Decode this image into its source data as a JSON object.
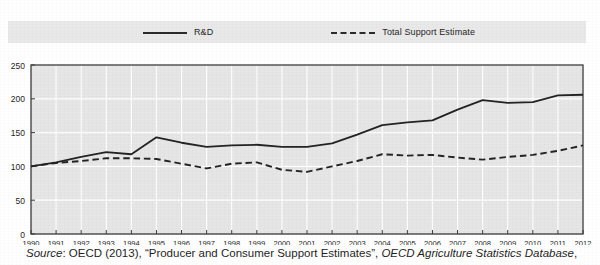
{
  "legend": {
    "position": "top",
    "entries": [
      {
        "label": "R&D",
        "style": "solid",
        "icon": "solid-line-icon"
      },
      {
        "label": "Total Support Estimate",
        "style": "dashed",
        "icon": "dashed-line-icon"
      }
    ]
  },
  "caption": {
    "source_word": "Source",
    "colon": ": ",
    "publisher": "OECD (2013), “Producer and Consumer Support Estimates”, ",
    "database": "OECD Agriculture Statistics Database",
    "trailing": ","
  },
  "colors": {
    "plot_background": "#e6e6e6",
    "legend_background": "#e9e9e9",
    "gridline": "#ffffff",
    "axis": "#3a3a3a",
    "line": "#232323",
    "page_background": "#ffffff"
  },
  "chart_data": {
    "type": "line",
    "title": "",
    "subtitle": "",
    "xlabel": "",
    "ylabel": "",
    "xlim": [
      1990,
      2012
    ],
    "ylim": [
      0,
      250
    ],
    "yticks": [
      0,
      50,
      100,
      150,
      200,
      250
    ],
    "grid": true,
    "legend_position": "top",
    "x": [
      1990,
      1991,
      1992,
      1993,
      1994,
      1995,
      1996,
      1997,
      1998,
      1999,
      2000,
      2001,
      2002,
      2003,
      2004,
      2005,
      2006,
      2007,
      2008,
      2009,
      2010,
      2011,
      2012
    ],
    "categories": [
      "1990",
      "1991",
      "1992",
      "1993",
      "1994",
      "1995",
      "1996",
      "1997",
      "1998",
      "1999",
      "2000",
      "2001",
      "2002",
      "2003",
      "2004",
      "2005",
      "2006",
      "2007",
      "2008",
      "2009",
      "2010",
      "2011",
      "2012"
    ],
    "series": [
      {
        "name": "R&D",
        "style": "solid",
        "values": [
          100,
          106,
          114,
          121,
          118,
          143,
          135,
          129,
          131,
          132,
          129,
          129,
          134,
          147,
          161,
          165,
          168,
          184,
          198,
          194,
          195,
          205,
          206
        ]
      },
      {
        "name": "Total Support Estimate",
        "style": "dashed",
        "values": [
          100,
          105,
          108,
          112,
          112,
          111,
          104,
          97,
          104,
          106,
          95,
          92,
          100,
          108,
          118,
          116,
          117,
          113,
          110,
          114,
          117,
          123,
          131
        ]
      }
    ]
  }
}
